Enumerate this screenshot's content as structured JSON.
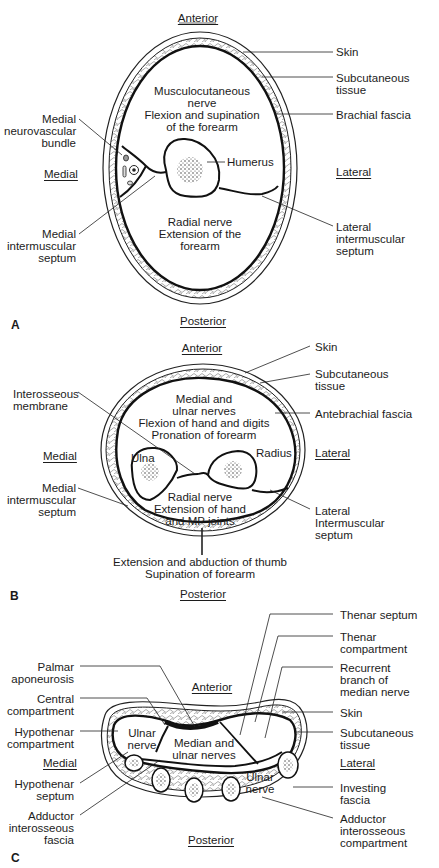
{
  "panel_a": {
    "letter": "A",
    "orientation": {
      "anterior": "Anterior",
      "posterior": "Posterior",
      "medial": "Medial",
      "lateral": "Lateral"
    },
    "compartments": {
      "anterior": "Musculocutaneous\nnerve\nFlexion and supination\nof the forearm",
      "posterior": "Radial nerve\nExtension of the\nforearm"
    },
    "labels": {
      "skin": "Skin",
      "subcutaneous": "Subcutaneous\ntissue",
      "fascia": "Brachial fascia",
      "neurovascular": "Medial\nneurovascular\nbundle",
      "humerus": "Humerus",
      "medial_septum": "Medial\nintermuscular\nseptum",
      "lateral_septum": "Lateral\nintermuscular\nseptum"
    }
  },
  "panel_b": {
    "letter": "B",
    "orientation": {
      "anterior": "Anterior",
      "posterior": "Posterior",
      "medial": "Medial",
      "lateral": "Lateral"
    },
    "compartments": {
      "anterior": "Medial and\nulnar nerves\nFlexion of hand and digits\nPronation of forearm",
      "posterior": "Radial nerve\nExtension of hand\nand MP joints",
      "thumb": "Extension and abduction of thumb\nSupination of forearm"
    },
    "labels": {
      "skin": "Skin",
      "subcutaneous": "Subcutaneous\ntissue",
      "fascia": "Antebrachial fascia",
      "interosseous": "Interosseous\nmembrane",
      "ulna": "Ulna",
      "radius": "Radius",
      "medial_septum": "Medial\nintermuscular\nseptum",
      "lateral_septum": "Lateral\nIntermuscular\nseptum"
    }
  },
  "panel_c": {
    "letter": "C",
    "orientation": {
      "anterior": "Anterior",
      "posterior": "Posterior",
      "medial": "Medial",
      "lateral": "Lateral"
    },
    "compartments": {
      "hypothenar": "Ulnar\nnerve",
      "central": "Median and\nulnar nerves",
      "adductor": "Ulnar\nnerve"
    },
    "labels": {
      "thenar_septum": "Thenar septum",
      "thenar_compartment": "Thenar\ncompartment",
      "recurrent_branch": "Recurrent\nbranch of\nmedian nerve",
      "skin": "Skin",
      "subcutaneous": "Subcutaneous\ntissue",
      "investing_fascia": "Investing\nfascia",
      "adductor_compartment": "Adductor\ninterosseous\ncompartment",
      "palmar_aponeurosis": "Palmar\naponeurosis",
      "central_compartment": "Central\ncompartment",
      "hypothenar_compartment": "Hypothenar\ncompartment",
      "hypothenar_septum": "Hypothenar\nseptum",
      "adductor_fascia": "Adductor\ninterosseous\nfascia"
    }
  }
}
